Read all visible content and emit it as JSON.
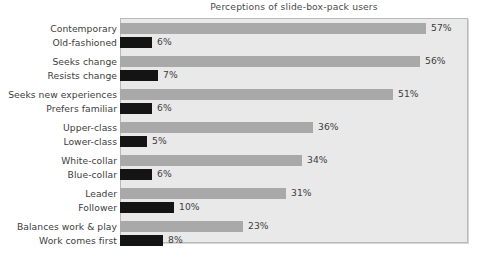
{
  "chart_data": {
    "type": "bar",
    "orientation": "horizontal",
    "title": "Perceptions of slide-box-pack users",
    "subtitle": "",
    "xlabel": "",
    "ylabel": "",
    "xlim": [
      0,
      65
    ],
    "grid": false,
    "legend": null,
    "value_suffix": "%",
    "series": [
      {
        "name": "positive-attribute",
        "color": "#a9a9a9"
      },
      {
        "name": "negative-attribute",
        "color": "#141414"
      }
    ],
    "groups": [
      {
        "positive_label": "Contemporary",
        "positive_value": 57,
        "positive_value_label": "57%",
        "negative_label": "Old-fashioned",
        "negative_value": 6,
        "negative_value_label": "6%"
      },
      {
        "positive_label": "Seeks change",
        "positive_value": 56,
        "positive_value_label": "56%",
        "negative_label": "Resists change",
        "negative_value": 7,
        "negative_value_label": "7%"
      },
      {
        "positive_label": "Seeks new experiences",
        "positive_value": 51,
        "positive_value_label": "51%",
        "negative_label": "Prefers familiar",
        "negative_value": 6,
        "negative_value_label": "6%"
      },
      {
        "positive_label": "Upper-class",
        "positive_value": 36,
        "positive_value_label": "36%",
        "negative_label": "Lower-class",
        "negative_value": 5,
        "negative_value_label": "5%"
      },
      {
        "positive_label": "White-collar",
        "positive_value": 34,
        "positive_value_label": "34%",
        "negative_label": "Blue-collar",
        "negative_value": 6,
        "negative_value_label": "6%"
      },
      {
        "positive_label": "Leader",
        "positive_value": 31,
        "positive_value_label": "31%",
        "negative_label": "Follower",
        "negative_value": 10,
        "negative_value_label": "10%"
      },
      {
        "positive_label": "Balances work & play",
        "positive_value": 23,
        "positive_value_label": "23%",
        "negative_label": "Work comes first",
        "negative_value": 8,
        "negative_value_label": "8%"
      }
    ]
  },
  "style": {
    "plot_background": "#e9e9e9",
    "plot_border": "#b9b9b9",
    "page_background": "#ffffff",
    "text_color": "#3d3d3d",
    "positive_bar_color": "#a9a9a9",
    "negative_bar_color": "#141414"
  },
  "geometry": {
    "plot_left": 120,
    "plot_top": 18,
    "plot_width": 348,
    "plot_height": 225,
    "px_per_percent": 5.36,
    "bar_height": 11,
    "row_gap": 3,
    "group_gap": 8,
    "group_start": 5
  }
}
